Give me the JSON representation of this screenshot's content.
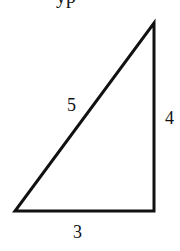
{
  "figure": {
    "type": "right-triangle",
    "top_caption_fragment": "yp",
    "stroke_color": "#111111",
    "background": "#ffffff",
    "vertices": {
      "bottom_left": [
        15,
        211
      ],
      "bottom_right": [
        154,
        211
      ],
      "top_right": [
        154,
        23
      ]
    },
    "labels": {
      "hypotenuse": "5",
      "vertical_leg": "4",
      "base": "3"
    }
  }
}
